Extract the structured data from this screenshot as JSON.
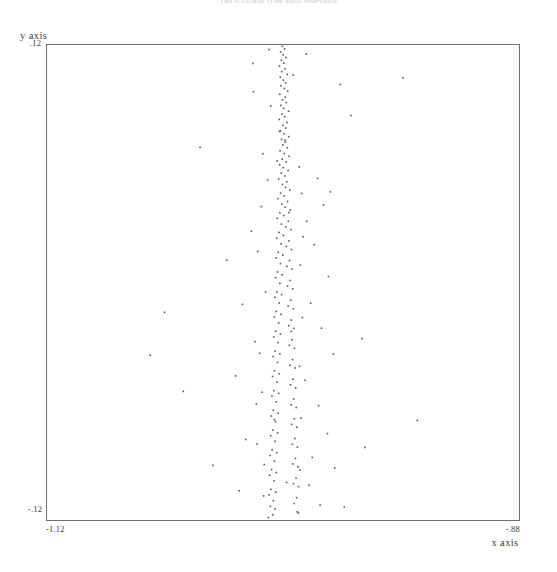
{
  "title": "This is a scatter of the whole observation",
  "axes": {
    "y_title": "y axis",
    "x_title": "x axis",
    "y_tick_max": ".12",
    "y_tick_min": "-.12",
    "x_tick_min": "-1.12",
    "x_tick_max": "-.88"
  },
  "chart_data": {
    "type": "scatter",
    "title": "This is a scatter of the whole observation",
    "xlabel": "x axis",
    "ylabel": "y axis",
    "xlim": [
      -1.12,
      -0.88
    ],
    "ylim": [
      -0.12,
      0.12
    ],
    "xticks": [
      -1.12,
      -0.88
    ],
    "xticklabels": [
      "-1.12",
      "-.88"
    ],
    "yticks": [
      -0.12,
      0.12
    ],
    "yticklabels": [
      "-.12",
      ".12"
    ],
    "grid": false,
    "legend": null,
    "marker": "point",
    "marker_color": "#57575c",
    "n_points": 232,
    "points": [
      [
        -1.0003,
        0.1188
      ],
      [
        -0.9992,
        0.1176
      ],
      [
        -1.0012,
        0.116
      ],
      [
        -1.0,
        0.1146
      ],
      [
        -0.9985,
        0.1132
      ],
      [
        -1.0008,
        0.1118
      ],
      [
        -0.9996,
        0.1104
      ],
      [
        -1.0018,
        0.1089
      ],
      [
        -0.999,
        0.1075
      ],
      [
        -1.0006,
        0.1061
      ],
      [
        -0.9979,
        0.1047
      ],
      [
        -1.0014,
        0.1033
      ],
      [
        -0.9998,
        0.1018
      ],
      [
        -0.9987,
        0.1004
      ],
      [
        -1.001,
        0.099
      ],
      [
        -0.9994,
        0.0976
      ],
      [
        -0.9976,
        0.0962
      ],
      [
        -1.0016,
        0.0947
      ],
      [
        -0.9989,
        0.0933
      ],
      [
        -1.0002,
        0.0919
      ],
      [
        -0.9983,
        0.0905
      ],
      [
        -1.0011,
        0.0891
      ],
      [
        -0.9997,
        0.0876
      ],
      [
        -0.9972,
        0.0862
      ],
      [
        -1.0005,
        0.0848
      ],
      [
        -0.9991,
        0.0834
      ],
      [
        -1.0019,
        0.082
      ],
      [
        -0.998,
        0.0805
      ],
      [
        -1.0,
        0.0791
      ],
      [
        -0.9986,
        0.0777
      ],
      [
        -1.0013,
        0.0763
      ],
      [
        -0.9995,
        0.0749
      ],
      [
        -0.9971,
        0.0734
      ],
      [
        -1.0007,
        0.072
      ],
      [
        -0.9988,
        0.0706
      ],
      [
        -1.0001,
        0.0692
      ],
      [
        -0.9978,
        0.0678
      ],
      [
        -1.0015,
        0.0663
      ],
      [
        -0.9993,
        0.0649
      ],
      [
        -0.9969,
        0.0635
      ],
      [
        -1.0004,
        0.0621
      ],
      [
        -0.9984,
        0.0607
      ],
      [
        -1.0017,
        0.0592
      ],
      [
        -0.9999,
        0.0578
      ],
      [
        -0.9974,
        0.0564
      ],
      [
        -1.0009,
        0.055
      ],
      [
        -0.999,
        0.0536
      ],
      [
        -1.0022,
        0.0521
      ],
      [
        -0.9981,
        0.0507
      ],
      [
        -1.0003,
        0.0493
      ],
      [
        -0.9987,
        0.0479
      ],
      [
        -0.9966,
        0.0465
      ],
      [
        -1.0012,
        0.045
      ],
      [
        -0.9994,
        0.0436
      ],
      [
        -1.0026,
        0.0422
      ],
      [
        -0.9977,
        0.0408
      ],
      [
        -1.0006,
        0.0394
      ],
      [
        -0.9989,
        0.0379
      ],
      [
        -0.9963,
        0.0365
      ],
      [
        -1.0016,
        0.0351
      ],
      [
        -0.9996,
        0.0337
      ],
      [
        -1.0029,
        0.0323
      ],
      [
        -0.9973,
        0.0308
      ],
      [
        -1.0008,
        0.0294
      ],
      [
        -0.9986,
        0.028
      ],
      [
        -0.996,
        0.0266
      ],
      [
        -1.002,
        0.0252
      ],
      [
        -0.9998,
        0.0237
      ],
      [
        -1.0032,
        0.0223
      ],
      [
        -0.997,
        0.0209
      ],
      [
        -1.001,
        0.0195
      ],
      [
        -0.9983,
        0.0181
      ],
      [
        -0.9957,
        0.0166
      ],
      [
        -1.0024,
        0.0152
      ],
      [
        -1.0001,
        0.0138
      ],
      [
        -1.0035,
        0.0124
      ],
      [
        -0.9967,
        0.011
      ],
      [
        -1.0013,
        0.0095
      ],
      [
        -0.998,
        0.0081
      ],
      [
        -0.9954,
        0.0067
      ],
      [
        -1.0028,
        0.0053
      ],
      [
        -1.0004,
        0.0039
      ],
      [
        -1.0038,
        0.0024
      ],
      [
        -0.9964,
        0.001
      ],
      [
        -1.0016,
        -0.0004
      ],
      [
        -0.9977,
        -0.0018
      ],
      [
        -0.9951,
        -0.0032
      ],
      [
        -1.0031,
        -0.0047
      ],
      [
        -1.0007,
        -0.0061
      ],
      [
        -1.0041,
        -0.0075
      ],
      [
        -0.9961,
        -0.0089
      ],
      [
        -1.0019,
        -0.0103
      ],
      [
        -0.9974,
        -0.0118
      ],
      [
        -0.9948,
        -0.0132
      ],
      [
        -1.0034,
        -0.0146
      ],
      [
        -1.001,
        -0.016
      ],
      [
        -1.0044,
        -0.0174
      ],
      [
        -0.9958,
        -0.0189
      ],
      [
        -1.0022,
        -0.0203
      ],
      [
        -0.9971,
        -0.0217
      ],
      [
        -0.9945,
        -0.0231
      ],
      [
        -1.0037,
        -0.0245
      ],
      [
        -1.0013,
        -0.026
      ],
      [
        -1.0047,
        -0.0274
      ],
      [
        -0.9955,
        -0.0288
      ],
      [
        -1.0025,
        -0.0302
      ],
      [
        -0.9968,
        -0.0316
      ],
      [
        -0.9942,
        -0.0331
      ],
      [
        -1.004,
        -0.0345
      ],
      [
        -1.0016,
        -0.0359
      ],
      [
        -1.005,
        -0.0373
      ],
      [
        -0.9952,
        -0.0388
      ],
      [
        -1.0028,
        -0.0402
      ],
      [
        -0.9965,
        -0.0416
      ],
      [
        -0.9939,
        -0.043
      ],
      [
        -1.0043,
        -0.0444
      ],
      [
        -1.0019,
        -0.0459
      ],
      [
        -1.0053,
        -0.0473
      ],
      [
        -0.9949,
        -0.0487
      ],
      [
        -1.0031,
        -0.0501
      ],
      [
        -0.9962,
        -0.0515
      ],
      [
        -0.9936,
        -0.053
      ],
      [
        -1.0046,
        -0.0544
      ],
      [
        -1.0022,
        -0.0558
      ],
      [
        -1.0056,
        -0.0572
      ],
      [
        -0.9946,
        -0.0586
      ],
      [
        -1.0034,
        -0.0601
      ],
      [
        -0.9959,
        -0.0615
      ],
      [
        -0.9933,
        -0.0629
      ],
      [
        -1.0049,
        -0.0643
      ],
      [
        -1.0025,
        -0.0657
      ],
      [
        -1.0059,
        -0.0672
      ],
      [
        -0.9943,
        -0.0686
      ],
      [
        -1.0037,
        -0.07
      ],
      [
        -0.9956,
        -0.0714
      ],
      [
        -0.993,
        -0.0728
      ],
      [
        -1.0052,
        -0.0743
      ],
      [
        -1.0028,
        -0.0757
      ],
      [
        -1.0062,
        -0.0771
      ],
      [
        -0.994,
        -0.0785
      ],
      [
        -1.004,
        -0.0799
      ],
      [
        -0.9953,
        -0.0814
      ],
      [
        -0.9927,
        -0.0828
      ],
      [
        -1.0055,
        -0.0842
      ],
      [
        -1.0031,
        -0.0856
      ],
      [
        -1.0065,
        -0.087
      ],
      [
        -0.9937,
        -0.0885
      ],
      [
        -1.0043,
        -0.0899
      ],
      [
        -0.995,
        -0.0913
      ],
      [
        -0.9924,
        -0.0927
      ],
      [
        -1.0058,
        -0.0941
      ],
      [
        -1.0034,
        -0.0956
      ],
      [
        -1.0068,
        -0.097
      ],
      [
        -0.9934,
        -0.0984
      ],
      [
        -1.0046,
        -0.0998
      ],
      [
        -0.9947,
        -0.1012
      ],
      [
        -0.9921,
        -0.1027
      ],
      [
        -1.0061,
        -0.1041
      ],
      [
        -1.0037,
        -0.1055
      ],
      [
        -1.0071,
        -0.1069
      ],
      [
        -0.9931,
        -0.1083
      ],
      [
        -1.0049,
        -0.1098
      ],
      [
        -0.9944,
        -0.1112
      ],
      [
        -1.0064,
        -0.1126
      ],
      [
        -1.004,
        -0.114
      ],
      [
        -0.9928,
        -0.1154
      ],
      [
        -1.0052,
        -0.1169
      ],
      [
        -1.0074,
        -0.1183
      ],
      [
        -0.9825,
        0.0524
      ],
      [
        -0.976,
        0.0456
      ],
      [
        -0.9795,
        0.039
      ],
      [
        -0.988,
        0.0308
      ],
      [
        -0.9842,
        0.019
      ],
      [
        -0.977,
        0.003
      ],
      [
        -0.986,
        -0.0104
      ],
      [
        -0.9805,
        -0.023
      ],
      [
        -0.9745,
        -0.036
      ],
      [
        -0.9888,
        -0.0492
      ],
      [
        -0.982,
        -0.062
      ],
      [
        -0.9775,
        -0.076
      ],
      [
        -0.9852,
        -0.088
      ],
      [
        -0.9738,
        -0.0934
      ],
      [
        -0.9868,
        -0.102
      ],
      [
        -0.9812,
        -0.112
      ],
      [
        -1.016,
        0.0258
      ],
      [
        -1.0205,
        -0.011
      ],
      [
        -1.0118,
        -0.0356
      ],
      [
        -1.024,
        -0.047
      ],
      [
        -1.0135,
        -0.0612
      ],
      [
        -1.0188,
        -0.079
      ],
      [
        -1.0095,
        -0.0916
      ],
      [
        -1.0222,
        -0.1048
      ],
      [
        -0.9655,
        0.084
      ],
      [
        -0.932,
        -0.0694
      ],
      [
        -1.06,
        -0.015
      ],
      [
        -1.042,
        0.068
      ],
      [
        -0.96,
        -0.0282
      ],
      [
        -1.0355,
        -0.092
      ],
      [
        -0.971,
        0.0996
      ],
      [
        -1.0285,
        0.0112
      ],
      [
        -0.9585,
        -0.083
      ],
      [
        -1.0505,
        -0.0548
      ],
      [
        -0.9392,
        0.103
      ],
      [
        -1.0152,
        0.1102
      ],
      [
        -0.969,
        -0.113
      ],
      [
        -1.0672,
        -0.0366
      ],
      [
        -0.9882,
        0.115
      ],
      [
        -1.007,
        0.1172
      ],
      [
        -0.999,
        0.0716
      ],
      [
        -1.0102,
        0.0648
      ],
      [
        -0.9918,
        0.0582
      ],
      [
        -1.0078,
        0.0516
      ],
      [
        -0.9906,
        0.0448
      ],
      [
        -1.011,
        0.0382
      ],
      [
        -0.9898,
        0.023
      ],
      [
        -1.0128,
        0.0156
      ],
      [
        -0.9912,
        0.0088
      ],
      [
        -1.0088,
        -0.0048
      ],
      [
        -0.9902,
        -0.0176
      ],
      [
        -1.0142,
        -0.0298
      ],
      [
        -0.9916,
        -0.0422
      ],
      [
        -1.0106,
        -0.0552
      ],
      [
        -0.9908,
        -0.0682
      ],
      [
        -1.0132,
        -0.0812
      ],
      [
        -0.9914,
        -0.0944
      ],
      [
        -1.0098,
        -0.1074
      ],
      [
        -0.9922,
        -0.116
      ],
      [
        -1.015,
        0.096
      ],
      [
        -0.9948,
        0.1044
      ],
      [
        -1.0062,
        0.0888
      ],
      [
        -0.997,
        0.0352
      ],
      [
        -1.0044,
        -0.069
      ],
      [
        -0.9982,
        -0.1006
      ],
      [
        -1.0018,
        0.076
      ],
      [
        -0.9958,
        -0.0246
      ],
      [
        -1.003,
        0.0612
      ]
    ]
  }
}
